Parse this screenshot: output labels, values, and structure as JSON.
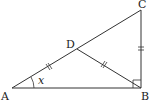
{
  "diagram": {
    "type": "geometry",
    "points": {
      "A": {
        "label": "A",
        "x": 12,
        "y": 88
      },
      "B": {
        "label": "B",
        "x": 141,
        "y": 88
      },
      "C": {
        "label": "C",
        "x": 141,
        "y": 10
      },
      "D": {
        "label": "D",
        "x": 77,
        "y": 49
      }
    },
    "segments": [
      {
        "from": "A",
        "to": "B"
      },
      {
        "from": "B",
        "to": "C"
      },
      {
        "from": "A",
        "to": "C"
      },
      {
        "from": "D",
        "to": "B"
      }
    ],
    "equal_marks": [
      "AD",
      "DB",
      "CB"
    ],
    "right_angle": "B",
    "angle_label": {
      "vertex": "A",
      "text": "x"
    },
    "stroke_color": "#333333"
  }
}
